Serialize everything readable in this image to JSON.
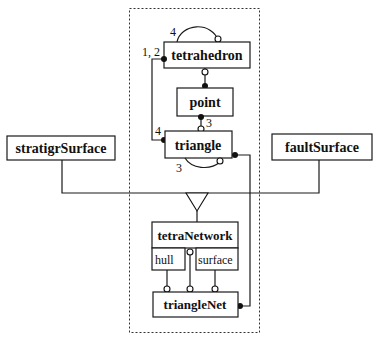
{
  "diagram": {
    "type": "class-diagram",
    "container": {
      "style": "dashed"
    },
    "classes": {
      "tetrahedron": "tetrahedron",
      "point": "point",
      "triangle": "triangle",
      "stratigrSurface": "stratigrSurface",
      "faultSurface": "faultSurface",
      "tetraNetwork": "tetraNetwork",
      "triangleNet": "triangleNet"
    },
    "compartments": {
      "hull": "hull",
      "surface": "surface"
    },
    "multiplicities": {
      "tetrahedron_self": "4",
      "tetrahedron_triangle": "1, 2",
      "triangle_tetrahedron": "4",
      "point_triangle": "3",
      "triangle_self": "3"
    },
    "colors": {
      "stroke": "#1a1a1a",
      "background": "#ffffff"
    }
  }
}
